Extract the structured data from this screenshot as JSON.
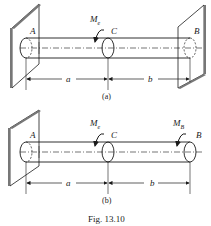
{
  "figure": {
    "caption": "Fig. 13.10",
    "panel_a": {
      "label": "(a)",
      "point_a": "A",
      "point_c": "C",
      "point_b": "B",
      "moment_label": "M",
      "moment_sub": "e",
      "dim_a": "a",
      "dim_b": "b"
    },
    "panel_b": {
      "label": "(b)",
      "point_a": "A",
      "point_c": "C",
      "point_b": "B",
      "moment_e_label": "M",
      "moment_e_sub": "e",
      "moment_b_label": "M",
      "moment_b_sub": "B",
      "dim_a": "a",
      "dim_b": "b"
    }
  },
  "colors": {
    "line": "#1a1a1a",
    "wall_shade": "#777777"
  }
}
